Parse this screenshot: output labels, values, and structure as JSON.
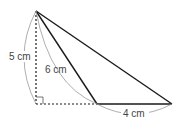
{
  "figure": {
    "type": "triangle-diagram",
    "labels": {
      "height": "5 cm",
      "slant_side": "6 cm",
      "base": "4 cm"
    },
    "colors": {
      "line": "#1a1a1a",
      "arc": "#999999",
      "text": "#444444"
    }
  }
}
